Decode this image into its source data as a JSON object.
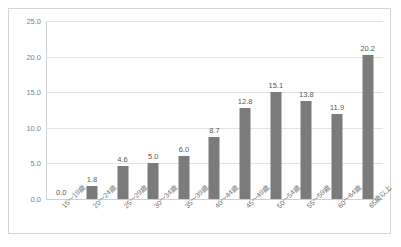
{
  "chart_data": {
    "type": "bar",
    "title": "",
    "subtitle": "",
    "xlabel": "",
    "ylabel": "",
    "categories": [
      "15～19歳",
      "20～24歳",
      "25～29歳",
      "30～34歳",
      "35～39歳",
      "40～44歳",
      "45～49歳",
      "50～54歳",
      "55～59歳",
      "60～64歳",
      "65歳以上"
    ],
    "values": [
      0.0,
      1.8,
      4.6,
      5.0,
      6.0,
      8.7,
      12.8,
      15.1,
      13.8,
      11.9,
      20.2
    ],
    "data_labels": [
      "0.0",
      "1.8",
      "4.6",
      "5.0",
      "6.0",
      "8.7",
      "12.8",
      "15.1",
      "13.8",
      "11.9",
      "20.2"
    ],
    "ylim": [
      0.0,
      25.0
    ],
    "ytick_values": [
      0.0,
      5.0,
      10.0,
      15.0,
      20.0,
      25.0
    ],
    "ytick_labels": [
      "0.0",
      "5.0",
      "10.0",
      "15.0",
      "20.0",
      "25.0"
    ],
    "grid": true,
    "legend": false,
    "legend_position": "none",
    "bar_color": "#7b7b7b",
    "gridline_color": "#e3e3e3",
    "axis_color": "#d0d0d0",
    "border_color": "#d4d4d4",
    "background_color": "#ffffff",
    "label_color": "#6f6f6f",
    "value_label_color": "#5a5a5a"
  }
}
